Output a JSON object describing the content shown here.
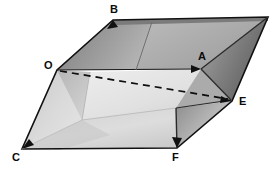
{
  "figure": {
    "kind": "geometry-diagram",
    "canvas": {
      "width": 279,
      "height": 170,
      "background": "#ffffff"
    },
    "colors": {
      "outline": "#111111",
      "dashed": "#0d0d0d",
      "top_face_dark": "#8f8f8f",
      "top_face_mid": "#a6a6a6",
      "top_face_light": "#c9c9c9",
      "right_face_dark": "#6f6f6f",
      "right_face_mid": "#9a9a9a",
      "inner_face_light": "#dcdcdc",
      "inner_face_pale": "#e9e9e9",
      "floor_face": "#cfcfcf",
      "floor_face_pale": "#e4e4e4",
      "background": "#ffffff"
    },
    "vertices": [
      {
        "id": "B",
        "label": "B",
        "x": 113,
        "y": 20,
        "label_x": 110,
        "label_y": 4,
        "arrow": true
      },
      {
        "id": "T",
        "label": "",
        "x": 268,
        "y": 17,
        "label_x": 0,
        "label_y": 0,
        "arrow": false
      },
      {
        "id": "O",
        "label": "O",
        "x": 57,
        "y": 70,
        "label_x": 44,
        "label_y": 61,
        "arrow": false
      },
      {
        "id": "A",
        "label": "A",
        "x": 201,
        "y": 69,
        "label_x": 198,
        "label_y": 52,
        "arrow": true
      },
      {
        "id": "E",
        "label": "E",
        "x": 232,
        "y": 101,
        "label_x": 239,
        "label_y": 96,
        "arrow": true
      },
      {
        "id": "C",
        "label": "C",
        "x": 22,
        "y": 149,
        "label_x": 12,
        "label_y": 150,
        "arrow": true
      },
      {
        "id": "F",
        "label": "F",
        "x": 177,
        "y": 148,
        "label_x": 172,
        "label_y": 150,
        "arrow": true
      }
    ],
    "edges": [
      {
        "from": "O",
        "to": "A",
        "style": "solid",
        "arrow_at": "A"
      },
      {
        "from": "O",
        "to": "E",
        "style": "dashed",
        "arrow_at": "E"
      },
      {
        "from": "O",
        "to": "B",
        "style": "solid",
        "arrow_at": "B"
      },
      {
        "from": "O",
        "to": "C",
        "style": "solid",
        "arrow_at": "C"
      },
      {
        "from": "B",
        "to": "T",
        "style": "solid",
        "arrow_at": "none"
      },
      {
        "from": "T",
        "to": "A",
        "style": "solid",
        "arrow_at": "none"
      },
      {
        "from": "T",
        "to": "E",
        "style": "solid",
        "arrow_at": "none"
      },
      {
        "from": "A",
        "to": "E",
        "style": "solid",
        "arrow_at": "none"
      },
      {
        "from": "C",
        "to": "F",
        "style": "solid",
        "arrow_at": "none"
      },
      {
        "from": "F",
        "to": "E",
        "style": "solid",
        "arrow_at": "none"
      },
      {
        "from": "F",
        "to": "A",
        "style": "solid",
        "arrow_at": "none"
      }
    ],
    "labels": {
      "B": "B",
      "O": "O",
      "A": "A",
      "E": "E",
      "C": "C",
      "F": "F"
    }
  }
}
